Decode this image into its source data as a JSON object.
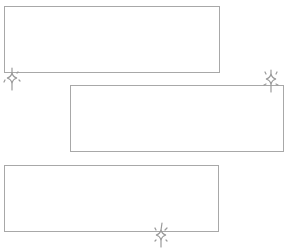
{
  "diagram": {
    "stroke_color": "#a8a8a8",
    "background": "#ffffff",
    "boxes": [
      {
        "name": "box-top",
        "x": 4,
        "y": 6,
        "width": 216,
        "height": 67
      },
      {
        "name": "box-middle",
        "x": 70,
        "y": 85,
        "width": 214,
        "height": 67
      },
      {
        "name": "box-bottom",
        "x": 4,
        "y": 165,
        "width": 215,
        "height": 67
      }
    ],
    "sparkles": [
      {
        "name": "sparkle-icon-top-left",
        "x": 1,
        "y": 66
      },
      {
        "name": "sparkle-icon-middle-right",
        "x": 260,
        "y": 68
      },
      {
        "name": "sparkle-icon-bottom-center",
        "x": 150,
        "y": 222
      }
    ]
  }
}
